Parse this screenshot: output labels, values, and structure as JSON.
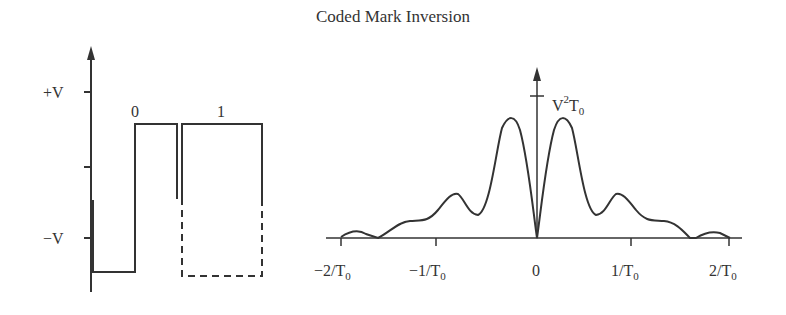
{
  "title": "Coded Mark Inversion",
  "left_plot": {
    "y_ticks": [
      "+V",
      "−V"
    ],
    "bit_labels": [
      "0",
      "1"
    ]
  },
  "right_plot": {
    "peak_label_main": "V",
    "peak_label_sup": "2",
    "peak_label_T": "T",
    "peak_label_sub": "0",
    "x_ticks": [
      {
        "main": "−2/T",
        "sub": "0"
      },
      {
        "main": "−1/T",
        "sub": "0"
      },
      {
        "main": "0",
        "sub": ""
      },
      {
        "main": "1/T",
        "sub": "0"
      },
      {
        "main": "2/T",
        "sub": "0"
      }
    ]
  },
  "colors": {
    "line": "#333333",
    "background": "#ffffff"
  }
}
